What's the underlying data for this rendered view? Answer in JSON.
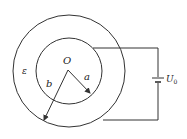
{
  "diagram": {
    "type": "concentric-spherical-capacitor-circuit",
    "labels": {
      "center": "O",
      "inner_radius": "a",
      "outer_radius": "b",
      "dielectric": "ε",
      "voltage_main": "U",
      "voltage_sub": "0"
    },
    "geometry": {
      "center": [
        69,
        71
      ],
      "inner_radius_px": 33,
      "outer_radius_px": 56
    },
    "colors": {
      "stroke": "#333333",
      "background": "#ffffff"
    }
  }
}
